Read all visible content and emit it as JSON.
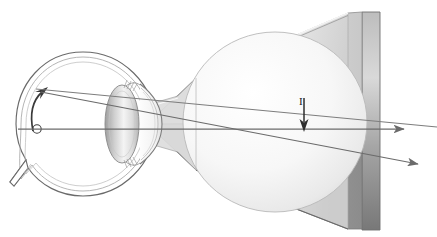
{
  "figure": {
    "type": "anatomical-optics-diagram",
    "background_color": "#ffffff",
    "width": 437,
    "height": 237
  },
  "palette": {
    "outline": "#5a5a5a",
    "outline_light": "#9a9a9a",
    "ray": "#6b6b6b",
    "arrow_dark": "#3a3a3a",
    "cone_light": "#f2f2f2",
    "cone_mid": "#d4d4d4",
    "cone_dark": "#8a8a8a",
    "cone_darkest": "#6f6f6f",
    "sphere_light": "#fbfbfb",
    "sphere_shade": "#e3e3e3",
    "lens_light": "#fdfdfd",
    "lens_shade": "#b8b8b8",
    "sclera_fill": "#ffffff"
  },
  "eye": {
    "label": "eye-cross-section",
    "center_x": 83,
    "center_y": 124,
    "radius_x": 72,
    "radius_y": 72,
    "parts": [
      {
        "name": "sclera",
        "label": "sclera"
      },
      {
        "name": "choroid",
        "label": "choroid"
      },
      {
        "name": "retina",
        "label": "retina"
      },
      {
        "name": "cornea",
        "label": "cornea"
      },
      {
        "name": "lens",
        "label": "lens"
      },
      {
        "name": "ciliary-body",
        "label": "ciliary body"
      },
      {
        "name": "optic-nerve",
        "label": "optic nerve"
      },
      {
        "name": "fovea-marker",
        "label": "fovea"
      },
      {
        "name": "retinal-image-arrow",
        "label": "inverted retinal image"
      }
    ]
  },
  "retinal_image": {
    "name": "inverted-image-arrow",
    "description": "small upward-curving arrow on the retina representing the inverted image",
    "tail_x": 36,
    "tail_y": 128,
    "tip_x": 46,
    "tip_y": 90
  },
  "fovea_marker": {
    "name": "fovea-circle",
    "cx": 37,
    "cy": 129,
    "r": 4.2
  },
  "object": {
    "name": "object-arrow",
    "label": "I",
    "description": "downward arrow inside the cone denoting the object",
    "x": 304,
    "top_y": 98,
    "tip_y": 131,
    "label_x": 302,
    "label_y": 104
  },
  "cone": {
    "name": "visual-field-cone",
    "apex_x": 160,
    "apex_y": 124,
    "far_x": 380,
    "top_far_y": 12,
    "bottom_far_y": 230,
    "description": "truncated funnel / cone widening from the eye to the right"
  },
  "sphere": {
    "name": "object-sphere",
    "cx": 275,
    "cy": 122,
    "rx": 92,
    "ry": 90
  },
  "rays": [
    {
      "name": "ray-upper-chief",
      "from_x": 36,
      "from_y": 89,
      "to_x": 437,
      "to_y": 126,
      "arrowhead": false
    },
    {
      "name": "ray-optical-axis",
      "from_x": 18,
      "from_y": 129,
      "to_x": 412,
      "to_y": 129,
      "arrowhead": true
    },
    {
      "name": "ray-lower-chief",
      "from_x": 40,
      "from_y": 90,
      "to_x": 425,
      "to_y": 166,
      "arrowhead": true
    }
  ],
  "annotations": {
    "object_label": "I"
  }
}
